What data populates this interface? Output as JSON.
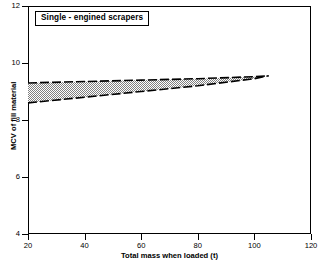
{
  "chart_data": {
    "type": "area",
    "title": "Single - engined scrapers",
    "xlabel": "Total mass when loaded (t)",
    "ylabel": "MCV of fill material",
    "xlim": [
      20,
      120
    ],
    "ylim": [
      4,
      12
    ],
    "xticks": [
      20,
      40,
      60,
      80,
      100,
      120
    ],
    "yticks": [
      4,
      6,
      8,
      10,
      12
    ],
    "grid": false,
    "legend": "none",
    "annotations": [],
    "series": [
      {
        "name": "Upper bound",
        "style": "dashed",
        "x": [
          20,
          40,
          60,
          80,
          100,
          105
        ],
        "values": [
          9.3,
          9.35,
          9.4,
          9.45,
          9.52,
          9.55
        ]
      },
      {
        "name": "Lower bound",
        "style": "dashed",
        "x": [
          20,
          40,
          60,
          80,
          100,
          105
        ],
        "values": [
          8.6,
          8.8,
          9.0,
          9.2,
          9.45,
          9.55
        ]
      }
    ],
    "band": {
      "name": "Acceptable MCV range",
      "fill": "stipple-grey",
      "fill_color": "#9a9a9a",
      "edge_color": "#000000",
      "x_start": 20,
      "x_end": 105
    }
  },
  "axes": {
    "y_tick_labels": [
      "12",
      "10",
      "8",
      "6",
      "4"
    ],
    "x_tick_labels": [
      "20",
      "40",
      "60",
      "80",
      "100",
      "120"
    ]
  },
  "colors": {
    "background": "#ffffff",
    "foreground": "#000000",
    "band_fill": "#9a9a9a"
  }
}
